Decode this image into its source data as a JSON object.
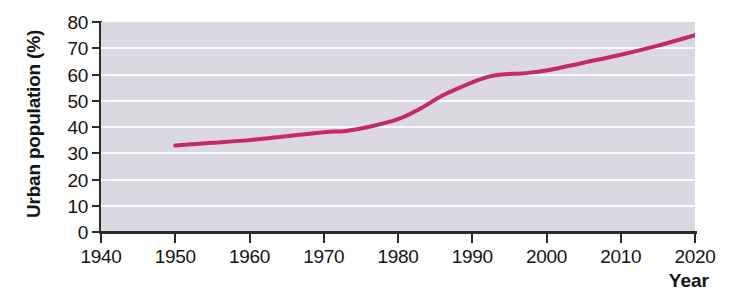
{
  "chart_data": {
    "type": "line",
    "title": "",
    "xlabel": "Year",
    "ylabel": "Urban population (%)",
    "xlim": [
      1940,
      2020
    ],
    "ylim": [
      0,
      80
    ],
    "xticks": [
      1940,
      1950,
      1960,
      1970,
      1980,
      1990,
      2000,
      2010,
      2020
    ],
    "yticks": [
      0,
      10,
      20,
      30,
      40,
      50,
      60,
      70,
      80
    ],
    "grid": "horizontal",
    "legend": "none",
    "plot_background_color": "#dcd8e2",
    "gridline_color": "#fbfafc",
    "axis_color": "#2b2b2b",
    "series": [
      {
        "name": "Urban population",
        "color": "#c42a6b",
        "line_width": 4,
        "x": [
          1950,
          1955,
          1960,
          1965,
          1970,
          1973,
          1976,
          1980,
          1983,
          1986,
          1990,
          1992,
          1994,
          1997,
          2000,
          2005,
          2010,
          2015,
          2020
        ],
        "values": [
          33,
          34,
          35,
          36.5,
          38,
          38.5,
          40,
          43,
          47,
          52,
          57,
          59,
          60,
          60.5,
          61.5,
          64.5,
          67.5,
          71,
          75
        ]
      }
    ]
  },
  "axis": {
    "y_title": "Urban population (%)",
    "x_title": "Year",
    "y_labels": [
      "80",
      "70",
      "60",
      "50",
      "40",
      "30",
      "20",
      "10",
      "0"
    ],
    "x_labels": [
      "1940",
      "1950",
      "1960",
      "1970",
      "1980",
      "1990",
      "2000",
      "2010",
      "2020"
    ]
  }
}
